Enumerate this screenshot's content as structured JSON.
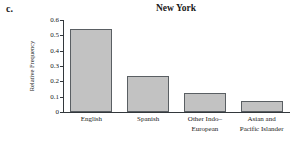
{
  "panel": {
    "letter": "c."
  },
  "chart_data": {
    "type": "bar",
    "title": "New York",
    "xlabel": "",
    "ylabel": "Relative Frequency",
    "categories": [
      "English",
      "Spanish",
      "Other Indo–European",
      "Asian and Pacific Islander"
    ],
    "category_lines": [
      [
        "English"
      ],
      [
        "Spanish"
      ],
      [
        "Other Indo–",
        "European"
      ],
      [
        "Asian and",
        "Pacific Islander"
      ]
    ],
    "values": [
      0.54,
      0.235,
      0.125,
      0.075
    ],
    "ylim": [
      0,
      0.6
    ],
    "yticks": [
      0,
      0.1,
      0.2,
      0.3,
      0.4,
      0.5,
      0.6
    ],
    "ytick_labels": [
      "0",
      "0.1",
      "0.2",
      "0.3",
      "0.4",
      "0.5",
      "0.6"
    ],
    "grid": false,
    "legend": null,
    "bar_fill_color": "#c2c2c2",
    "bar_edge_color": "#5a5f63",
    "axis_color": "#33383c"
  }
}
